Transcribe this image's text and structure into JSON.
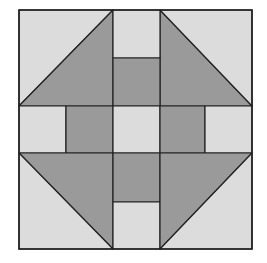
{
  "diagram": {
    "type": "quilt-block",
    "colors": {
      "light": "#dcdcdc",
      "dark": "#9a9a9a",
      "stroke": "#222222",
      "background": "#ffffff"
    },
    "outer": {
      "x1": 19,
      "y1": 10,
      "x2": 252,
      "y2": 249
    },
    "grid": {
      "x": [
        19,
        66,
        113,
        160,
        205,
        252
      ],
      "y": [
        10,
        58,
        106,
        153,
        202,
        249
      ]
    },
    "pieces": [
      {
        "name": "top-left-corner-light",
        "fill": "light",
        "points": "19,10 113,10 19,106"
      },
      {
        "name": "top-left-triangle-dark",
        "fill": "dark",
        "points": "113,10 113,106 19,106"
      },
      {
        "name": "top-right-triangle-dark",
        "fill": "dark",
        "points": "160,10 252,106 160,106"
      },
      {
        "name": "top-right-corner-light",
        "fill": "light",
        "points": "160,10 252,10 252,106"
      },
      {
        "name": "top-center-light",
        "fill": "light",
        "points": "113,10 160,10 160,58 113,58"
      },
      {
        "name": "top-center-dark",
        "fill": "dark",
        "points": "113,58 160,58 160,106 113,106"
      },
      {
        "name": "mid-left-light",
        "fill": "light",
        "points": "19,106 66,106 66,153 19,153"
      },
      {
        "name": "mid-left-dark",
        "fill": "dark",
        "points": "66,106 113,106 113,153 66,153"
      },
      {
        "name": "center-light",
        "fill": "light",
        "points": "113,106 160,106 160,153 113,153"
      },
      {
        "name": "mid-right-dark",
        "fill": "dark",
        "points": "160,106 205,106 205,153 160,153"
      },
      {
        "name": "mid-right-light",
        "fill": "light",
        "points": "205,106 252,106 252,153 205,153"
      },
      {
        "name": "bottom-left-triangle-dark",
        "fill": "dark",
        "points": "19,153 113,153 113,249"
      },
      {
        "name": "bottom-left-corner-light",
        "fill": "light",
        "points": "19,153 113,249 19,249"
      },
      {
        "name": "bottom-center-dark",
        "fill": "dark",
        "points": "113,153 160,153 160,202 113,202"
      },
      {
        "name": "bottom-center-light",
        "fill": "light",
        "points": "113,202 160,202 160,249 113,249"
      },
      {
        "name": "bottom-right-triangle-dark",
        "fill": "dark",
        "points": "160,153 252,153 160,249"
      },
      {
        "name": "bottom-right-corner-light",
        "fill": "light",
        "points": "252,153 252,249 160,249"
      }
    ]
  }
}
